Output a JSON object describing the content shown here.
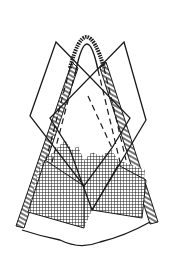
{
  "figure": {
    "background": "#ffffff",
    "ink": "#1a1a1a",
    "elements": [
      {
        "name": "fringed-peak",
        "type": "outline with hatch fringe"
      },
      {
        "name": "left-triangle-panel",
        "type": "folded flap"
      },
      {
        "name": "right-triangle-panel",
        "type": "folded flap"
      },
      {
        "name": "dashed-fold-lines",
        "type": "dashed guides"
      },
      {
        "name": "crosshatched-base",
        "type": "mesh fill"
      },
      {
        "name": "curved-bottom-edge",
        "type": "outline"
      }
    ]
  }
}
